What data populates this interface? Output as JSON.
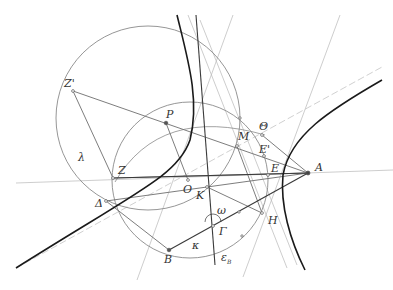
{
  "figure": {
    "type": "geometric-construction",
    "colors": {
      "background": "#ffffff",
      "hyperbola": "#1a1a1a",
      "circle": "#8a8a8a",
      "dark_line": "#3a3a3a",
      "mid_line": "#6e6e6e",
      "light_line": "#b5b5b5",
      "asymptote": "#c4c4c4",
      "label": "#333333"
    },
    "points": [
      {
        "id": "A",
        "label": "A",
        "x": 308,
        "y": 173
      },
      {
        "id": "O",
        "label": "O",
        "x": 188,
        "y": 180
      },
      {
        "id": "K",
        "label": "K",
        "x": 207,
        "y": 187
      },
      {
        "id": "P",
        "label": "P",
        "x": 166,
        "y": 123
      },
      {
        "id": "Zp",
        "label": "Z'",
        "x": 73,
        "y": 91
      },
      {
        "id": "Z",
        "label": "Z",
        "x": 113,
        "y": 178
      },
      {
        "id": "Delta",
        "label": "Δ",
        "x": 106,
        "y": 201
      },
      {
        "id": "B",
        "label": "B",
        "x": 169,
        "y": 250
      },
      {
        "id": "Gamma",
        "label": "Γ",
        "x": 213,
        "y": 226
      },
      {
        "id": "E",
        "label": "E",
        "x": 268,
        "y": 175
      },
      {
        "id": "Ep",
        "label": "E'",
        "x": 264,
        "y": 156
      },
      {
        "id": "M",
        "label": "M",
        "x": 237,
        "y": 146
      },
      {
        "id": "Theta",
        "label": "Θ",
        "x": 262,
        "y": 135
      },
      {
        "id": "H",
        "label": "H",
        "x": 262,
        "y": 213
      }
    ],
    "curve_labels": {
      "lambda": "λ",
      "kappa": "κ",
      "omega": "ω",
      "epsilon": "ε",
      "epsilon_sub": "B"
    }
  }
}
